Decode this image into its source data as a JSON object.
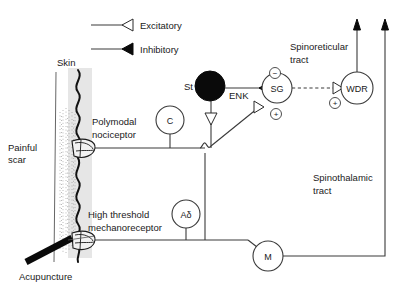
{
  "figure": {
    "background_color": "#ffffff",
    "line_color": "#3a3a3a",
    "skin_band_color": "#e6e6e6",
    "inhibitory_color": "#0a0a0a"
  },
  "legend": {
    "items": [
      {
        "label": "Excitatory",
        "marker": "open-triangle",
        "marker_name": "excitatory-arrowhead-icon"
      },
      {
        "label": "Inhibitory",
        "marker": "filled-triangle",
        "marker_name": "inhibitory-arrowhead-icon"
      }
    ]
  },
  "labels": {
    "skin": "Skin",
    "painful_scar": "Painful\nscar",
    "painful_scar_line1": "Painful",
    "painful_scar_line2": "scar",
    "acupuncture": "Acupuncture",
    "polymodal_line1": "Polymodal",
    "polymodal_line2": "nociceptor",
    "high_threshold_line1": "High threshold",
    "high_threshold_line2": "mechanoreceptor",
    "spinoreticular_line1": "Spinoreticular",
    "spinoreticular_line2": "tract",
    "spinothalamic_line1": "Spinothalamic",
    "spinothalamic_line2": "tract",
    "enk": "ENK",
    "st": "St"
  },
  "nodes": [
    {
      "id": "C",
      "label": "C",
      "name": "node-c-fiber"
    },
    {
      "id": "St",
      "label": "St",
      "name": "node-st-interneuron"
    },
    {
      "id": "SG",
      "label": "SG",
      "name": "node-sg-substantia-gelatinosa"
    },
    {
      "id": "WDR",
      "label": "WDR",
      "name": "node-wdr-neuron"
    },
    {
      "id": "Ad",
      "label": "Aδ",
      "name": "node-a-delta-fiber"
    },
    {
      "id": "M",
      "label": "M",
      "name": "node-m-neuron"
    }
  ],
  "signs": [
    {
      "id": "sg-minus",
      "symbol": "−",
      "name": "sign-minus-sg"
    },
    {
      "id": "sg-plus",
      "symbol": "+",
      "name": "sign-plus-sg"
    },
    {
      "id": "wdr-plus",
      "symbol": "+",
      "name": "sign-plus-wdr"
    }
  ]
}
